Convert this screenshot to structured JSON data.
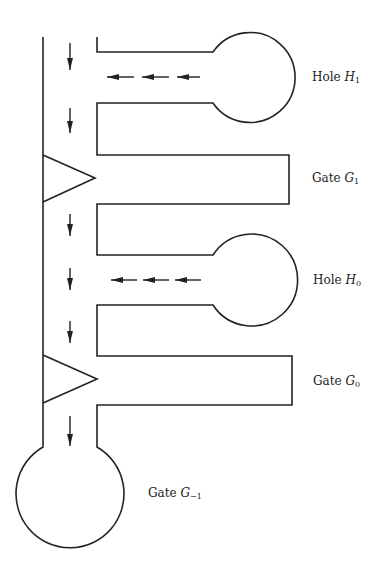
{
  "diagram": {
    "title": "",
    "labels": {
      "hole_h1": {
        "prefix": "Hole",
        "var": "H",
        "sub": "1"
      },
      "gate_g1": {
        "prefix": "Gate",
        "var": "G",
        "sub": "1"
      },
      "hole_h0": {
        "prefix": "Hole",
        "var": "H",
        "sub": "0"
      },
      "gate_g0": {
        "prefix": "Gate",
        "var": "G",
        "sub": "0"
      },
      "gate_gm1": {
        "prefix": "Gate",
        "var": "G",
        "sub": "−1"
      }
    },
    "components": [
      {
        "name": "Hole H1",
        "type": "hole",
        "shape": "side-arm with circular bulb"
      },
      {
        "name": "Gate G1",
        "type": "gate",
        "shape": "rectangular side-arm with triangular valve"
      },
      {
        "name": "Hole H0",
        "type": "hole",
        "shape": "side-arm with circular bulb"
      },
      {
        "name": "Gate G0",
        "type": "gate",
        "shape": "rectangular side-arm with triangular valve"
      },
      {
        "name": "Gate G-1",
        "type": "gate",
        "shape": "terminal circular reservoir"
      }
    ],
    "flow": {
      "main_channel": "downward",
      "hole_arms": "leftward toward main channel"
    },
    "colors": {
      "line": "#222222",
      "background": "#ffffff"
    }
  }
}
